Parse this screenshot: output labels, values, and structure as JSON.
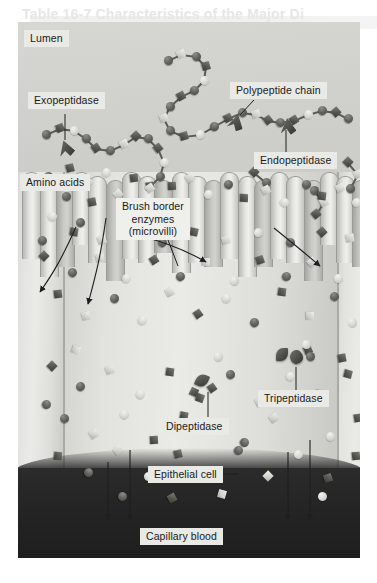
{
  "figure": {
    "title_ghost": "Table 16-7 Characteristics of the Major Di",
    "subtitle_ghost": "Enzyme",
    "type": "biological-illustration"
  },
  "labels": {
    "lumen": "Lumen",
    "polypeptide_chain": "Polypeptide chain",
    "exopeptidase": "Exopeptidase",
    "endopeptidase": "Endopeptidase",
    "amino_acids": "Amino acids",
    "brush_border_line1": "Brush border",
    "brush_border_line2": "enzymes",
    "brush_border_line3": "(microvilli)",
    "dipeptidase": "Dipeptidase",
    "tripeptidase": "Tripeptidase",
    "epithelial_cell": "Epithelial cell",
    "capillary_blood": "Capillary blood"
  },
  "colors": {
    "lumen_bg": "#cdcdc9",
    "cell_bg": "#eaeae6",
    "capillary_bg": "#262626",
    "label_box": "#e9e9e5",
    "ink": "#1a1a1a",
    "molecule_dark": "#4b4b48",
    "molecule_light": "#d6d6d2"
  },
  "legend_semantics": [
    {
      "glyph": "dark-sphere",
      "meaning": "amino acid residue (dark)"
    },
    {
      "glyph": "light-sphere",
      "meaning": "amino acid residue (light)"
    },
    {
      "glyph": "dark-diamond",
      "meaning": "amino acid residue (dark, angular)"
    },
    {
      "glyph": "light-diamond",
      "meaning": "amino acid residue (light, angular)"
    },
    {
      "glyph": "wedge-enzyme",
      "meaning": "peptidase enzyme"
    }
  ],
  "structures": {
    "microvilli_count": 21,
    "epithelial_cells_visible": 3,
    "absorption_arrows": 4
  }
}
